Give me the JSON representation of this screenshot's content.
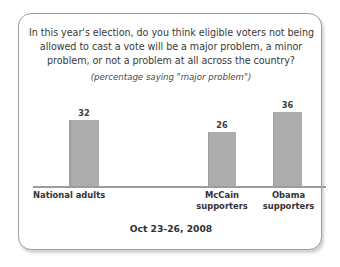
{
  "card": {
    "border_color": "#a0a0a0",
    "background": "#ffffff"
  },
  "chart_data": {
    "type": "bar",
    "title": "In this year's election, do you think eligible voters not being allowed to cast a vote will be a major problem, a minor problem, or not a problem at all across the country?",
    "title_lines": [
      "In this year's election, do you think eligible voters not being",
      "allowed to cast a vote will be a major problem, a minor",
      "problem, or not a problem at all across the country?"
    ],
    "subtitle": "(percentage saying \"major problem\")",
    "footer": "Oct 23-26, 2008",
    "categories": [
      "National adults",
      "McCain supporters",
      "Obama supporters"
    ],
    "category_lines": [
      [
        "National adults"
      ],
      [
        "McCain",
        "supporters"
      ],
      [
        "Obama",
        "supporters"
      ]
    ],
    "values": [
      32,
      26,
      36
    ],
    "value_labels": [
      "32",
      "26",
      "36"
    ],
    "xlabel": "",
    "ylabel": "",
    "ylim": [
      0,
      43
    ],
    "grid": false,
    "legend": "none",
    "bar_color": "#adadad",
    "axis_color": "#9c9c9c"
  }
}
